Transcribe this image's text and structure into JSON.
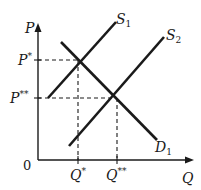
{
  "diagram": {
    "type": "supply-demand",
    "axes": {
      "y_label": "P",
      "x_label": "Q",
      "origin_label": "0"
    },
    "price_labels": {
      "p_star": "P*",
      "p_star_star": "P**"
    },
    "quantity_labels": {
      "q_star": "Q*",
      "q_star_star": "Q**"
    },
    "curves": [
      {
        "name": "S1",
        "label_main": "S",
        "label_sub": "1",
        "kind": "supply"
      },
      {
        "name": "S2",
        "label_main": "S",
        "label_sub": "2",
        "kind": "supply"
      },
      {
        "name": "D1",
        "label_main": "D",
        "label_sub": "1",
        "kind": "demand"
      }
    ],
    "equilibria": [
      {
        "name": "E1",
        "price": "P*",
        "quantity": "Q*",
        "curves": [
          "S1",
          "D1"
        ]
      },
      {
        "name": "E2",
        "price": "P**",
        "quantity": "Q**",
        "curves": [
          "S2",
          "D1"
        ]
      }
    ],
    "colors": {
      "line": "#1a1a1a",
      "background": "#ffffff"
    }
  }
}
